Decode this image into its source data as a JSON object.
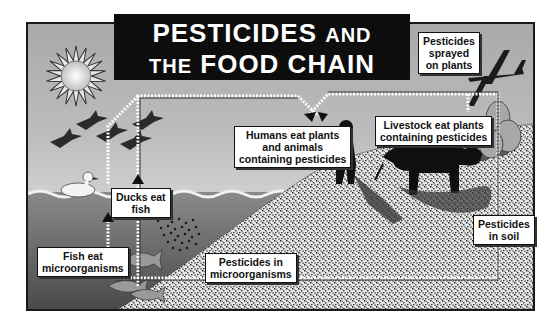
{
  "title": {
    "line1_big": "PESTICIDES",
    "line1_small": "AND",
    "line2_small": "THE",
    "line2_big": "FOOD CHAIN"
  },
  "labels": {
    "sprayed": [
      "Pesticides",
      "sprayed",
      "on plants"
    ],
    "humans": [
      "Humans eat plants",
      "and animals",
      "containing pesticides"
    ],
    "livestock": [
      "Livestock eat plants",
      "containing pesticides"
    ],
    "ducks": [
      "Ducks eat",
      "fish"
    ],
    "fish": [
      "Fish eat",
      "microorganisms"
    ],
    "micro": [
      "Pesticides in",
      "microorganisms"
    ],
    "soil": [
      "Pesticides",
      "in soil"
    ]
  },
  "icons": [
    "sun-icon",
    "geese-flock-icon",
    "duck-icon",
    "airplane-icon",
    "spray-cloud-icon",
    "human-silhouette-icon",
    "cow-silhouette-icon",
    "plants-icon",
    "fish-icon",
    "microorganisms-icon"
  ],
  "colors": {
    "sky": "#bdbdbd",
    "water": "#6e6e6e",
    "title_bg": "#0d0d0d",
    "label_bg": "#ffffff"
  }
}
